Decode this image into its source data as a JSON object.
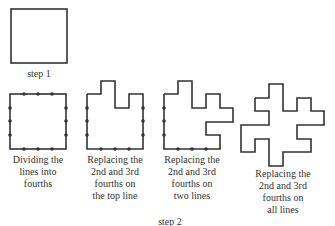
{
  "step1": {
    "label": "step 1"
  },
  "step2": {
    "label": "step 2"
  },
  "stroke_color": "#333333",
  "shapes": [
    {
      "caption_lines": [
        "Dividing the",
        "lines into",
        "fourths"
      ]
    },
    {
      "caption_lines": [
        "Replacing the",
        "2nd and 3rd",
        "fourths on",
        "the top line"
      ]
    },
    {
      "caption_lines": [
        "Replacing the",
        "2nd and 3rd",
        "fourths on",
        "two lines"
      ]
    },
    {
      "caption_lines": [
        "Replacing the",
        "2nd and 3rd",
        "fourths on",
        "all lines"
      ]
    }
  ]
}
